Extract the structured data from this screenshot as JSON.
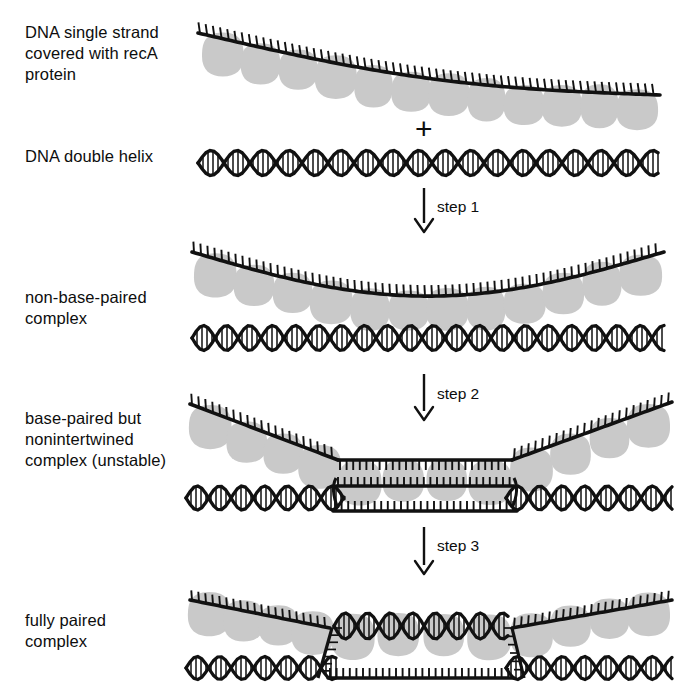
{
  "figure": {
    "background_color": "#ffffff",
    "ink_color": "#111111",
    "protein_color": "#c9c9c9",
    "width": 677,
    "height": 693
  },
  "labels": {
    "reactant_single_strand": "DNA single strand\ncovered with recA\nprotein",
    "reactant_duplex": "DNA double helix",
    "product_step1": "non-base-paired\ncomplex",
    "product_step2": "base-paired but\nnonintertwined\ncomplex (unstable)",
    "product_step3": "fully paired\ncomplex"
  },
  "operators": {
    "plus": "+"
  },
  "steps": [
    {
      "id": "step-1",
      "label": "step 1"
    },
    {
      "id": "step-2",
      "label": "step 2"
    },
    {
      "id": "step-3",
      "label": "step 3"
    }
  ],
  "panels": [
    {
      "id": "panel-reactants",
      "label_key": "reactant_single_strand",
      "elements": [
        "single-strand-with-reca",
        "plus-operator",
        "dna-double-helix"
      ]
    },
    {
      "id": "panel-non-base-paired",
      "label_key": "product_step1",
      "elements": [
        "single-strand-with-reca",
        "dna-double-helix"
      ]
    },
    {
      "id": "panel-base-paired",
      "label_key": "product_step2",
      "elements": [
        "single-strand-with-reca",
        "paired-flat-region",
        "dna-double-helix"
      ]
    },
    {
      "id": "panel-fully-paired",
      "label_key": "product_step3",
      "elements": [
        "single-strand-with-reca",
        "intertwined-heteroduplex",
        "displaced-strand",
        "dna-double-helix"
      ]
    }
  ]
}
